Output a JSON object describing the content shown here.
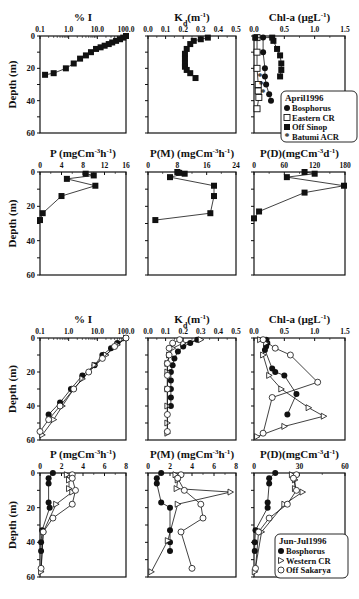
{
  "figure": {
    "top_group_label": "April1996",
    "bottom_group_label": "Jun-Jul1996",
    "ylabel": "Depth (m)"
  },
  "legends": {
    "april": {
      "title": "April1996",
      "items": [
        {
          "marker": "filled-circle",
          "label": "Bosphorus"
        },
        {
          "marker": "open-square",
          "label": "Eastern CR"
        },
        {
          "marker": "filled-square",
          "label": "Off Sinop"
        },
        {
          "marker": "star",
          "label": "Batumi ACR"
        }
      ]
    },
    "junjul": {
      "title": "Jun-Jul1996",
      "items": [
        {
          "marker": "filled-circle",
          "label": "Bosphorus"
        },
        {
          "marker": "open-triangle",
          "label": "Western CR"
        },
        {
          "marker": "open-circle",
          "label": "Off Sakarya"
        }
      ]
    }
  },
  "chart_data": [
    {
      "id": "apr_I",
      "type": "line",
      "title": "% I",
      "xscale": "log",
      "xticks": [
        "0.1",
        "1.0",
        "10.0",
        "100.0"
      ],
      "xlim": [
        0.1,
        100
      ],
      "ylabel": "Depth (m)",
      "yticks": [
        "0",
        "20",
        "40",
        "60"
      ],
      "ylim": [
        0,
        60
      ],
      "series": [
        {
          "name": "Off Sinop",
          "marker": "filled-square",
          "x": [
            100,
            80,
            62,
            45,
            33,
            25,
            18,
            13,
            9,
            6,
            4,
            2.5,
            1.5,
            0.8,
            0.3,
            0.15
          ],
          "y": [
            0,
            1,
            2,
            3,
            4,
            5,
            6,
            7,
            8,
            10,
            12,
            14,
            17,
            20,
            23,
            24
          ]
        }
      ]
    },
    {
      "id": "apr_Kd",
      "type": "line",
      "title": "Kd(m-1)",
      "xticks": [
        "0.0",
        "0.1",
        "0.2",
        "0.3",
        "0.4",
        "0.5"
      ],
      "xlim": [
        0,
        0.5
      ],
      "ylim": [
        0,
        60
      ],
      "series": [
        {
          "name": "Off Sinop",
          "marker": "filled-square",
          "x": [
            0.34,
            0.3,
            0.26,
            0.24,
            0.22,
            0.21,
            0.21,
            0.21,
            0.21,
            0.22,
            0.24,
            0.27
          ],
          "y": [
            1,
            2,
            3,
            5,
            8,
            11,
            14,
            17,
            19,
            21,
            23,
            26
          ]
        }
      ]
    },
    {
      "id": "apr_Chl",
      "type": "line",
      "title": "Chl-a (µgL-1)",
      "xticks": [
        "0.0",
        "0.5",
        "1.0",
        "1.5"
      ],
      "xlim": [
        0,
        1.5
      ],
      "ylim": [
        0,
        60
      ],
      "series": [
        {
          "name": "Bosphorus",
          "marker": "filled-circle",
          "x": [
            0.15,
            0.15,
            0.18,
            0.18,
            0.2,
            0.25,
            0.28
          ],
          "y": [
            1,
            10,
            20,
            25,
            30,
            36,
            40
          ]
        },
        {
          "name": "Eastern CR",
          "marker": "open-square",
          "x": [
            0.05,
            0.05,
            0.05,
            0.07,
            0.07,
            0.08,
            0.05
          ],
          "y": [
            1,
            10,
            20,
            30,
            34,
            38,
            45
          ]
        },
        {
          "name": "Off Sinop",
          "marker": "filled-square",
          "x": [
            0.02,
            0.3,
            0.32,
            0.38,
            0.43,
            0.45,
            0.45,
            0.43
          ],
          "y": [
            1,
            1,
            3,
            8,
            12,
            17,
            21,
            25
          ]
        },
        {
          "name": "Batumi ACR",
          "marker": "star",
          "x": [
            0.1,
            0.12,
            0.15
          ],
          "y": [
            25,
            30,
            35
          ]
        }
      ]
    },
    {
      "id": "apr_P",
      "type": "line",
      "title": "P (mgCm-3h-1)",
      "xticks": [
        "0",
        "4",
        "8",
        "12",
        "16"
      ],
      "xlim": [
        0,
        16
      ],
      "ylabel": "Depth (m)",
      "yticks": [
        "0",
        "20",
        "40",
        "60"
      ],
      "ylim": [
        0,
        60
      ],
      "series": [
        {
          "name": "Off Sinop",
          "marker": "filled-square",
          "x": [
            8.5,
            10,
            5,
            10.3,
            4,
            0.5,
            0
          ],
          "y": [
            1,
            2,
            4,
            8,
            14,
            24,
            28
          ]
        }
      ]
    },
    {
      "id": "apr_PM",
      "type": "line",
      "title": "P(M) (mgCm-3h-1)",
      "xticks": [
        "0",
        "8",
        "16",
        "24"
      ],
      "xlim": [
        0,
        24
      ],
      "ylim": [
        0,
        60
      ],
      "series": [
        {
          "name": "Off Sinop",
          "marker": "filled-square",
          "x": [
            8,
            8.5,
            10,
            6,
            18,
            18,
            17,
            2
          ],
          "y": [
            0,
            0.5,
            1,
            3,
            8,
            14,
            24,
            28
          ]
        }
      ]
    },
    {
      "id": "apr_PD",
      "type": "line",
      "title": "P(D)(mgCm-3d-1)",
      "xticks": [
        "0",
        "60",
        "120",
        "180"
      ],
      "xlim": [
        0,
        180
      ],
      "ylim": [
        0,
        60
      ],
      "series": [
        {
          "name": "Off Sinop",
          "marker": "filled-square",
          "x": [
            100,
            120,
            65,
            178,
            100,
            10,
            0
          ],
          "y": [
            0,
            1,
            3,
            8,
            12,
            23,
            27
          ]
        }
      ]
    },
    {
      "id": "jun_I",
      "type": "line",
      "title": "% I",
      "xscale": "log",
      "xticks": [
        "0.1",
        "1.0",
        "10.0",
        "100.0"
      ],
      "xlim": [
        0.1,
        100
      ],
      "ylabel": "Depth (m)",
      "yticks": [
        "0",
        "20",
        "40",
        "60"
      ],
      "ylim": [
        0,
        60
      ],
      "series": [
        {
          "name": "Bosphorus",
          "marker": "filled-circle",
          "x": [
            100,
            50,
            30,
            15,
            8,
            3,
            1.2,
            0.5,
            0.2
          ],
          "y": [
            0,
            3,
            6,
            10,
            16,
            22,
            30,
            38,
            45
          ]
        },
        {
          "name": "Western CR",
          "marker": "open-triangle",
          "x": [
            100,
            50,
            20,
            8,
            3,
            1.5,
            0.6,
            0.3,
            0.12
          ],
          "y": [
            0,
            4,
            10,
            16,
            24,
            30,
            40,
            48,
            57
          ]
        },
        {
          "name": "Off Sakarya",
          "marker": "open-circle",
          "x": [
            100,
            40,
            15,
            5,
            1.5,
            0.5,
            0.2,
            0.1
          ],
          "y": [
            0,
            5,
            12,
            20,
            30,
            40,
            48,
            55
          ]
        }
      ]
    },
    {
      "id": "jun_Kd",
      "type": "line",
      "title": "Kd(m-1)",
      "xticks": [
        "0.0",
        "0.1",
        "0.2",
        "0.3",
        "0.4",
        "0.5"
      ],
      "xlim": [
        0,
        0.5
      ],
      "ylim": [
        0,
        60
      ],
      "series": [
        {
          "name": "Bosphorus",
          "marker": "filled-circle",
          "x": [
            0.28,
            0.24,
            0.2,
            0.17,
            0.15,
            0.14,
            0.13,
            0.13,
            0.13,
            0.13,
            0.13
          ],
          "y": [
            1,
            3,
            5,
            8,
            12,
            16,
            20,
            25,
            30,
            35,
            40
          ]
        },
        {
          "name": "Western CR",
          "marker": "open-triangle",
          "x": [
            0.3,
            0.2,
            0.14,
            0.12,
            0.11,
            0.11,
            0.11,
            0.11,
            0.11,
            0.11
          ],
          "y": [
            1,
            3,
            6,
            10,
            15,
            20,
            30,
            40,
            50,
            56
          ]
        },
        {
          "name": "Off Sakarya",
          "marker": "open-circle",
          "x": [
            0.18,
            0.14,
            0.12,
            0.12,
            0.11,
            0.11,
            0.11,
            0.11,
            0.11
          ],
          "y": [
            1,
            3,
            6,
            10,
            15,
            22,
            30,
            45,
            55
          ]
        }
      ]
    },
    {
      "id": "jun_Chl",
      "type": "line",
      "title": "Chl-a (µgL-1)",
      "xticks": [
        "0.0",
        "0.5",
        "1.0",
        "1.5"
      ],
      "xlim": [
        0,
        1.5
      ],
      "ylim": [
        0,
        60
      ],
      "series": [
        {
          "name": "Bosphorus",
          "marker": "filled-circle",
          "x": [
            0.2,
            0.22,
            0.2,
            0.18,
            0.3,
            0.35,
            0.5,
            0.7,
            0.55
          ],
          "y": [
            1,
            3,
            5,
            7,
            18,
            20,
            22,
            33,
            45
          ]
        },
        {
          "name": "Western CR",
          "marker": "open-triangle",
          "x": [
            0.1,
            0.2,
            0.15,
            0.25,
            0.45,
            0.9,
            1.15,
            0.5,
            0.05
          ],
          "y": [
            1,
            3,
            10,
            22,
            30,
            41,
            46,
            52,
            58
          ]
        },
        {
          "name": "Off Sakarya",
          "marker": "open-circle",
          "x": [
            0.15,
            0.35,
            0.6,
            1.05,
            0.3,
            0.15
          ],
          "y": [
            1,
            6,
            10,
            26,
            35,
            56
          ]
        }
      ]
    },
    {
      "id": "jun_P",
      "type": "line",
      "title": "P (mgCm-3h-1)",
      "xticks": [
        "0",
        "2",
        "4",
        "6",
        "8"
      ],
      "xlim": [
        0,
        8
      ],
      "ylabel": "Depth (m)",
      "yticks": [
        "0",
        "20",
        "40",
        "60"
      ],
      "ylim": [
        0,
        60
      ],
      "series": [
        {
          "name": "Bosphorus",
          "marker": "filled-circle",
          "x": [
            1.2,
            0.8,
            0.8,
            0.8,
            0.9,
            0.2,
            0.1,
            0.1
          ],
          "y": [
            0,
            3,
            6,
            17,
            20,
            33,
            40,
            45
          ]
        },
        {
          "name": "Western CR",
          "marker": "open-triangle",
          "x": [
            2.5,
            2.7,
            2.7,
            3,
            1.5,
            0.3,
            0.1
          ],
          "y": [
            1,
            4,
            9,
            11,
            18,
            34,
            57
          ]
        },
        {
          "name": "Off Sakarya",
          "marker": "open-circle",
          "x": [
            3,
            3,
            3.3,
            3,
            1.2,
            0.3,
            0.1
          ],
          "y": [
            1,
            3,
            10,
            18,
            26,
            34,
            55
          ]
        }
      ]
    },
    {
      "id": "jun_PM",
      "type": "line",
      "title": "P(M) (mgCm-3h-1)",
      "xticks": [
        "0",
        "2",
        "4",
        "6",
        "8"
      ],
      "xlim": [
        0,
        8
      ],
      "ylim": [
        0,
        60
      ],
      "series": [
        {
          "name": "Bosphorus",
          "marker": "filled-circle",
          "x": [
            1.2,
            0.8,
            0.8,
            1.2,
            2,
            2,
            2,
            2
          ],
          "y": [
            0,
            3,
            6,
            17,
            20,
            33,
            40,
            45
          ]
        },
        {
          "name": "Western CR",
          "marker": "open-triangle",
          "x": [
            2.5,
            2.7,
            2.6,
            7.5,
            2.7,
            1.8,
            0.3
          ],
          "y": [
            1,
            4,
            9,
            11,
            18,
            39,
            57
          ]
        },
        {
          "name": "Off Sakarya",
          "marker": "open-circle",
          "x": [
            3,
            2.7,
            3.3,
            4.8,
            5,
            3,
            4
          ],
          "y": [
            1,
            3,
            10,
            18,
            26,
            34,
            55
          ]
        }
      ]
    },
    {
      "id": "jun_PD",
      "type": "line",
      "title": "P(D)(mgCm-3d-1)",
      "xticks": [
        "0",
        "30",
        "60"
      ],
      "xlim": [
        0,
        60
      ],
      "ylim": [
        0,
        60
      ],
      "series": [
        {
          "name": "Bosphorus",
          "marker": "filled-circle",
          "x": [
            14,
            10,
            10,
            9,
            9,
            1,
            0.5,
            0.5
          ],
          "y": [
            0,
            3,
            6,
            17,
            20,
            33,
            40,
            45
          ]
        },
        {
          "name": "Western CR",
          "marker": "open-triangle",
          "x": [
            25,
            27,
            27,
            32,
            20,
            5,
            0.5
          ],
          "y": [
            1,
            4,
            9,
            11,
            18,
            34,
            57
          ]
        },
        {
          "name": "Off Sakarya",
          "marker": "open-circle",
          "x": [
            28,
            26,
            28,
            22,
            10,
            3,
            1
          ],
          "y": [
            1,
            3,
            10,
            18,
            26,
            34,
            55
          ]
        }
      ]
    }
  ]
}
